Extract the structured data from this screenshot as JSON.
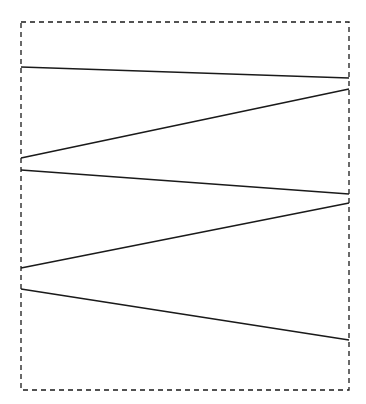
{
  "diagram": {
    "background": "#ffffff",
    "stroke_color": "#1a1a1a",
    "frame": {
      "style": "dashed",
      "x": 21,
      "y": 22,
      "width": 328,
      "height": 368
    },
    "segments": [
      {
        "x1": 21,
        "y1": 67,
        "x2": 349,
        "y2": 78
      },
      {
        "x1": 349,
        "y1": 89,
        "x2": 21,
        "y2": 158
      },
      {
        "x1": 21,
        "y1": 170,
        "x2": 349,
        "y2": 194
      },
      {
        "x1": 349,
        "y1": 203,
        "x2": 21,
        "y2": 268
      },
      {
        "x1": 21,
        "y1": 289,
        "x2": 349,
        "y2": 340
      }
    ]
  }
}
